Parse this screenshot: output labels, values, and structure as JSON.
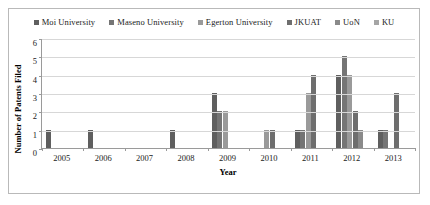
{
  "chart_data": {
    "type": "bar",
    "title": "",
    "xlabel": "Year",
    "ylabel": "Number of Patents Filed",
    "categories": [
      "2005",
      "2006",
      "2007",
      "2008",
      "2009",
      "2010",
      "2011",
      "2012",
      "2013"
    ],
    "ylim": [
      0,
      6
    ],
    "ytick_labels": [
      "0",
      "1",
      "2",
      "3",
      "4",
      "5",
      "6"
    ],
    "grid": "horizontal",
    "legend_position": "top",
    "series": [
      {
        "name": "Moi University",
        "color": "#5f5f5f",
        "values": [
          1,
          1,
          0,
          1,
          3,
          0,
          1,
          4,
          1
        ]
      },
      {
        "name": "Maseno University",
        "color": "#757575",
        "values": [
          0,
          0,
          0,
          0,
          2,
          0,
          1,
          5,
          1
        ]
      },
      {
        "name": "Egerton University",
        "color": "#9a9a9a",
        "values": [
          0,
          0,
          0,
          0,
          2,
          1,
          3,
          4,
          0
        ]
      },
      {
        "name": "JKUAT",
        "color": "#6e6e6e",
        "values": [
          0,
          0,
          0,
          0,
          0,
          1,
          4,
          2,
          3
        ]
      },
      {
        "name": "UoN",
        "color": "#8a8a8a",
        "values": [
          0,
          0,
          0,
          0,
          0,
          0,
          0,
          1,
          0
        ]
      },
      {
        "name": "KU",
        "color": "#a5a5a5",
        "values": [
          0,
          0,
          0,
          0,
          0,
          0,
          0,
          0,
          0
        ]
      }
    ]
  }
}
